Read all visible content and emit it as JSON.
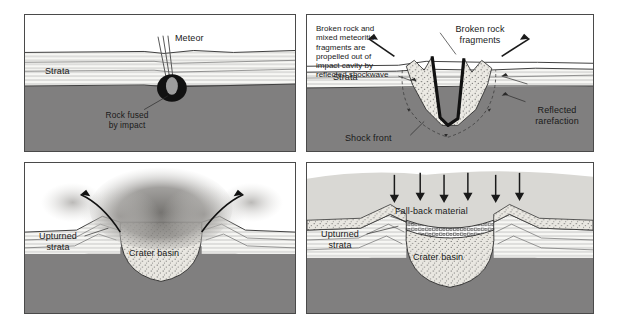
{
  "figure": {
    "background": "#ffffff",
    "panel_border_color": "#4a4a4a",
    "colors": {
      "bedrock": "#807f7f",
      "strata_fill": "#f7f7f4",
      "strata_line": "#5a5a5a",
      "breccia_fill": "#e8e6e0",
      "dust_cloud": "#8d8b88",
      "fallback_haze": "#d9d8d4",
      "meteor_body": "#111111",
      "ink": "#1a1a1a"
    }
  },
  "panels": [
    {
      "id": "panel-1",
      "name": "impact-stage",
      "labels": {
        "strata": "Strata",
        "meteor": "Meteor",
        "rock_fused": "Rock fused\nby impact"
      }
    },
    {
      "id": "panel-2",
      "name": "excavation-stage",
      "caption": "Broken rock and\nmixed meteoritic\nfragments are\npropelled out of\nimpact cavity by\nreflected shockwave",
      "labels": {
        "broken_rock_fragments": "Broken rock\nfragments",
        "strata": "Strata",
        "shock_front": "Shock front",
        "reflected_rarefaction": "Reflected\nrarefaction"
      }
    },
    {
      "id": "panel-3",
      "name": "ejecta-cloud-stage",
      "labels": {
        "upturned_strata": "Upturned\nstrata",
        "crater_basin": "Crater basin"
      }
    },
    {
      "id": "panel-4",
      "name": "fallback-stage",
      "labels": {
        "fall_back_material": "Fall-back material",
        "upturned_strata": "Upturned\nstrata",
        "crater_basin": "Crater basin"
      },
      "fallback_arrow_count": 6
    }
  ]
}
